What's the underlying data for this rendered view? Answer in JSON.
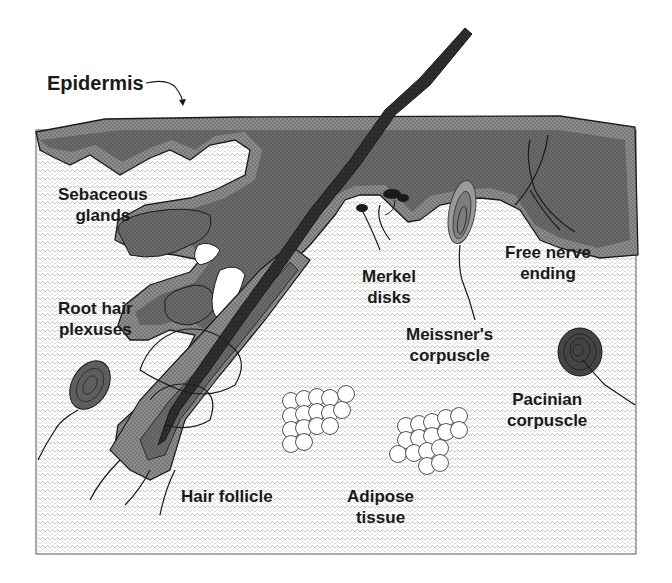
{
  "diagram": {
    "colors": {
      "background": "#ffffff",
      "dermis_pattern": "#c8c8c8",
      "epidermis_outer": "#8a8a8a",
      "epidermis_inner": "#6b6b6b",
      "hair_shaft": "#2b2b2b",
      "outline": "#1a1a1a",
      "pacinian": "#4a4a4a",
      "meissner": "#8c8c8c"
    },
    "labels": {
      "epidermis": "Epidermis",
      "sebaceous_1": "Sebaceous",
      "sebaceous_2": "glands",
      "root_hair_1": "Root hair",
      "root_hair_2": "plexuses",
      "merkel_1": "Merkel",
      "merkel_2": "disks",
      "free_nerve_1": "Free nerve",
      "free_nerve_2": "ending",
      "meissner_1": "Meissner's",
      "meissner_2": "corpuscle",
      "pacinian_1": "Pacinian",
      "pacinian_2": "corpuscle",
      "hair_follicle": "Hair follicle",
      "adipose_1": "Adipose",
      "adipose_2": "tissue"
    }
  }
}
